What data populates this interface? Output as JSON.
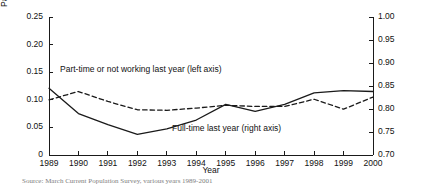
{
  "chart_data": {
    "type": "line",
    "title": "",
    "xlabel": "Year",
    "ylabel_left": "Part-time or not working",
    "ylabel_right": "Full-time",
    "grid": false,
    "legend_position": "inline-annotation",
    "x": [
      1989,
      1990,
      1991,
      1992,
      1993,
      1994,
      1995,
      1996,
      1997,
      1998,
      1999,
      2000
    ],
    "xticklabels": [
      "1989",
      "1990",
      "1991",
      "1992",
      "1993",
      "1994",
      "1995",
      "1996",
      "1997",
      "1998",
      "1999",
      "2000"
    ],
    "ylim_left": [
      0.0,
      0.25
    ],
    "yticks_left": [
      0.0,
      0.05,
      0.1,
      0.15,
      0.2,
      0.25
    ],
    "yticklabels_left": [
      "0",
      "0.05",
      "0.10",
      "0.15",
      "0.20",
      "0.25"
    ],
    "ylim_right": [
      0.7,
      1.0
    ],
    "yticks_right": [
      0.7,
      0.75,
      0.8,
      0.85,
      0.9,
      0.95,
      1.0
    ],
    "yticklabels_right": [
      "0.70",
      "0.75",
      "0.80",
      "0.85",
      "0.90",
      "0.95",
      "1.00"
    ],
    "series": [
      {
        "name": "Part-time or not working last year",
        "axis": "left",
        "style": "dashed",
        "color": "#1a1a1a",
        "annotation": "Part-time or not working last year (left axis)",
        "values": [
          0.1,
          0.115,
          0.097,
          0.082,
          0.081,
          0.085,
          0.09,
          0.088,
          0.088,
          0.101,
          0.083,
          0.105
        ]
      },
      {
        "name": "Full-time last year",
        "axis": "right",
        "style": "solid",
        "color": "#1a1a1a",
        "annotation": "Full-time last year (right axis)",
        "values": [
          0.845,
          0.79,
          0.766,
          0.745,
          0.757,
          0.776,
          0.81,
          0.795,
          0.81,
          0.835,
          0.84,
          0.838
        ]
      }
    ]
  },
  "source": {
    "text": "Source: March Current Population Survey, various years 1989-2001"
  }
}
